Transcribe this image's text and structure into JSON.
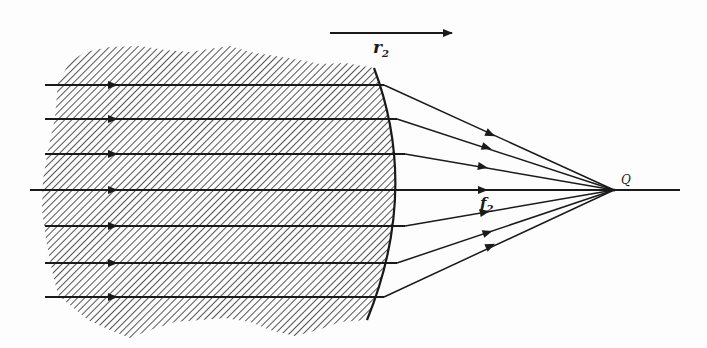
{
  "diagram": {
    "type": "optics-refraction",
    "labels": {
      "radius": "r",
      "radius_sub": "2",
      "focal": "f",
      "focal_sub": "2",
      "focus_point": "Q"
    },
    "direction_arrow": {
      "x1": 330,
      "x2": 452,
      "y": 33
    },
    "axis": {
      "y": 190,
      "x_start": 30,
      "x_end": 680
    },
    "focus": {
      "x": 614,
      "y": 190
    },
    "rays": [
      {
        "y": 85,
        "x_start": 45,
        "surface_x": 384
      },
      {
        "y": 119,
        "x_start": 45,
        "surface_x": 397
      },
      {
        "y": 154,
        "x_start": 45,
        "surface_x": 405
      },
      {
        "y": 190,
        "x_start": 30,
        "surface_x": 408
      },
      {
        "y": 226,
        "x_start": 45,
        "surface_x": 405
      },
      {
        "y": 263,
        "x_start": 45,
        "surface_x": 397
      },
      {
        "y": 297,
        "x_start": 45,
        "surface_x": 384
      }
    ],
    "colors": {
      "ink": "#1a1a1a",
      "hatch": "#2a2a2a",
      "paper": "#fdfdfd"
    }
  }
}
